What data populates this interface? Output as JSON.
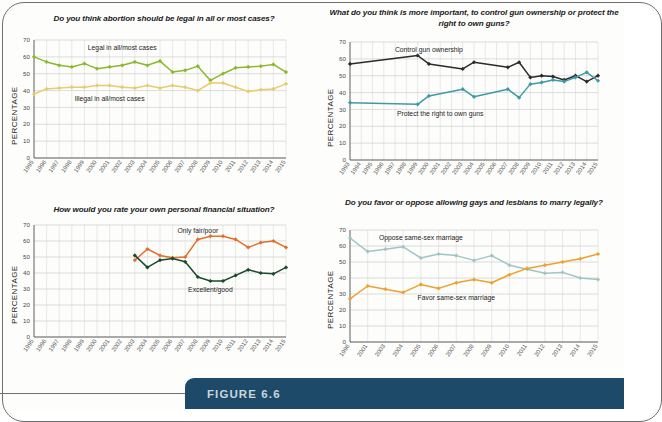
{
  "figure": {
    "banner_label": "FIGURE 6.6",
    "banner_color": "#1d4a68"
  },
  "axis": {
    "ylabel": "PERCENTAGE",
    "yticks": [
      0,
      10,
      20,
      30,
      40,
      50,
      60,
      70
    ],
    "ylim": [
      0,
      70
    ]
  },
  "chart_data": [
    {
      "id": "abortion",
      "type": "line",
      "title": "Do you think abortion should be legal in all or most cases?",
      "xlabel": "",
      "ylabel": "PERCENTAGE",
      "ylim": [
        0,
        70
      ],
      "grid": true,
      "legend_position": "inline-annotation",
      "categories": [
        "1995",
        "1996",
        "1997",
        "1998",
        "1999",
        "2000",
        "2001",
        "2002",
        "2003",
        "2004",
        "2005",
        "2006",
        "2007",
        "2008",
        "2009",
        "2010",
        "2011",
        "2012",
        "2013",
        "2014",
        "2015"
      ],
      "series": [
        {
          "name": "Legal in all/most cases",
          "color": "#8cb82b",
          "label_x_index": 7,
          "label_y": 64,
          "values": [
            60,
            57,
            55,
            54,
            56,
            53,
            54,
            55,
            57,
            55,
            57.5,
            51,
            52,
            54.5,
            46,
            50,
            53.5,
            54,
            54.5,
            55.5,
            51
          ]
        },
        {
          "name": "Illegal in all/most cases",
          "color": "#e8cb6e",
          "label_x_index": 6,
          "label_y": 34,
          "values": [
            38,
            41,
            41.5,
            42,
            42,
            43,
            43,
            42,
            41.5,
            43,
            41.5,
            43,
            42,
            40,
            44.5,
            44.5,
            42,
            39.5,
            40.5,
            41,
            44
          ]
        }
      ]
    },
    {
      "id": "guns",
      "type": "line",
      "title": "What do you think is more important, to control gun ownership or protect the right to own guns?",
      "xlabel": "",
      "ylabel": "PERCENTAGE",
      "ylim": [
        0,
        70
      ],
      "grid": true,
      "legend_position": "inline-annotation",
      "categories": [
        "1993",
        "1994",
        "1995",
        "1996",
        "1997",
        "1998",
        "1999",
        "2000",
        "2001",
        "2002",
        "2003",
        "2004",
        "2005",
        "2006",
        "2007",
        "2008",
        "2009",
        "2010",
        "2011",
        "2012",
        "2013",
        "2014",
        "2015"
      ],
      "series": [
        {
          "name": "Control gun ownership",
          "color": "#2b2b2b",
          "label_x_index": 7,
          "label_y": 64,
          "values": [
            57,
            null,
            null,
            null,
            null,
            null,
            62,
            57,
            null,
            null,
            54,
            58,
            null,
            null,
            55,
            58,
            49,
            50,
            49.5,
            47.5,
            50,
            46.5,
            50
          ]
        },
        {
          "name": "Protect the right to own guns",
          "color": "#3d9aa8",
          "label_x_index": 8,
          "label_y": 26,
          "values": [
            34,
            null,
            null,
            null,
            null,
            null,
            33,
            38,
            null,
            null,
            42,
            37.5,
            null,
            null,
            42,
            37,
            45,
            46,
            47.5,
            46.5,
            49,
            52,
            47
          ]
        }
      ]
    },
    {
      "id": "finances",
      "type": "line",
      "title": "How would you rate your own personal financial situation?",
      "xlabel": "",
      "ylabel": "PERCENTAGE",
      "ylim": [
        0,
        70
      ],
      "grid": true,
      "legend_position": "inline-annotation",
      "categories": [
        "1995",
        "1996",
        "1997",
        "1998",
        "1999",
        "2000",
        "2001",
        "2002",
        "2003",
        "2004",
        "2005",
        "2006",
        "2007",
        "2008",
        "2009",
        "2010",
        "2011",
        "2012",
        "2013",
        "2014",
        "2015"
      ],
      "series": [
        {
          "name": "Only fair/poor",
          "color": "#e3702a",
          "label_x_index": 13,
          "label_y": 65,
          "values": [
            null,
            null,
            null,
            null,
            null,
            null,
            null,
            null,
            48,
            55,
            51,
            49.5,
            50,
            61,
            63,
            63,
            61,
            56,
            59,
            60,
            56
          ]
        },
        {
          "name": "Excellent/good",
          "color": "#1d4a2e",
          "label_x_index": 14,
          "label_y": 28,
          "values": [
            null,
            null,
            null,
            null,
            null,
            null,
            null,
            null,
            51,
            43.5,
            48,
            49,
            47,
            37.5,
            35,
            35,
            38.5,
            42,
            40,
            39.5,
            43.5
          ]
        }
      ]
    },
    {
      "id": "samesex",
      "type": "line",
      "title": "Do you favor or oppose allowing gays and lesbians to marry legally?",
      "xlabel": "",
      "ylabel": "PERCENTAGE",
      "ylim": [
        0,
        70
      ],
      "grid": true,
      "legend_position": "inline-annotation",
      "categories": [
        "1996",
        "2001",
        "2003",
        "2004",
        "2005",
        "2006",
        "2007",
        "2008",
        "2009",
        "2010",
        "2011",
        "2012",
        "2013",
        "2014",
        "2015"
      ],
      "series": [
        {
          "name": "Oppose same-sex marriage",
          "color": "#9fc5c6",
          "label_x_index": 4,
          "label_y": 64,
          "values": [
            65,
            56.5,
            58,
            59.5,
            52.5,
            55,
            54,
            51,
            54,
            48,
            45.5,
            43,
            43.5,
            40,
            39
          ]
        },
        {
          "name": "Favor same-sex marriage",
          "color": "#efa02e",
          "label_x_index": 6,
          "label_y": 26,
          "values": [
            27,
            35,
            33,
            31,
            36,
            33.5,
            37,
            39,
            37,
            42,
            46,
            48,
            50,
            52,
            55
          ]
        }
      ]
    }
  ]
}
